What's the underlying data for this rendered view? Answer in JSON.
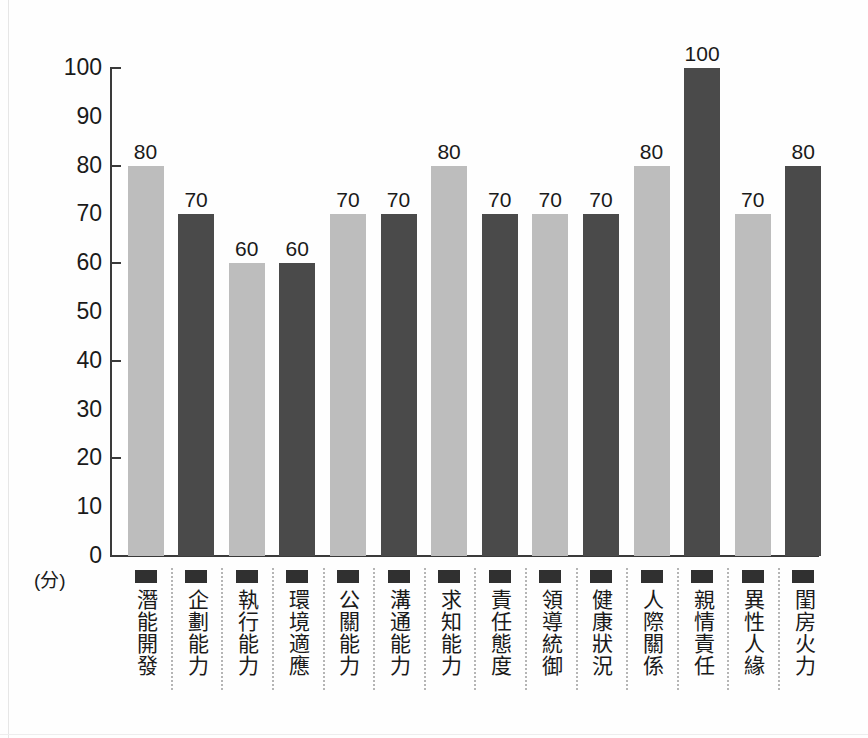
{
  "chart_data": {
    "type": "bar",
    "title": "",
    "subtitle": "",
    "xlabel": "",
    "ylabel": "(分)",
    "ylim": [
      0,
      100
    ],
    "y_ticks": [
      0,
      10,
      20,
      30,
      40,
      50,
      60,
      70,
      80,
      90,
      100
    ],
    "y_tick_marks": [
      0,
      20,
      40,
      60,
      80,
      100
    ],
    "grid": false,
    "legend": "none",
    "categories": [
      "潛能開發",
      "企劃能力",
      "執行能力",
      "環境適應",
      "公關能力",
      "溝通能力",
      "求知能力",
      "責任態度",
      "領導統御",
      "健康狀況",
      "人際關係",
      "親情責任",
      "異性人緣",
      "閨房火力"
    ],
    "values": [
      80,
      70,
      60,
      60,
      70,
      70,
      80,
      70,
      70,
      70,
      80,
      100,
      70,
      80
    ],
    "value_labels": [
      "80",
      "70",
      "60",
      "60",
      "70",
      "70",
      "80",
      "70",
      "70",
      "70",
      "80",
      "100",
      "70",
      "80"
    ],
    "bar_colors": [
      "#bdbdbd",
      "#4a4a4a",
      "#bdbdbd",
      "#4a4a4a",
      "#bdbdbd",
      "#4a4a4a",
      "#bdbdbd",
      "#4a4a4a",
      "#bdbdbd",
      "#4a4a4a",
      "#bdbdbd",
      "#4a4a4a",
      "#bdbdbd",
      "#4a4a4a"
    ],
    "colors": {
      "light_bar": "#bdbdbd",
      "dark_bar": "#4a4a4a",
      "axis": "#3a3a3a",
      "text": "#1a1a1a",
      "separator": "#b5b5b5",
      "background": "#ffffff"
    }
  },
  "axis": {
    "unit_label": "(分)",
    "tick_labels": [
      "100",
      "90",
      "80",
      "70",
      "60",
      "50",
      "40",
      "30",
      "20",
      "10",
      "0"
    ]
  }
}
